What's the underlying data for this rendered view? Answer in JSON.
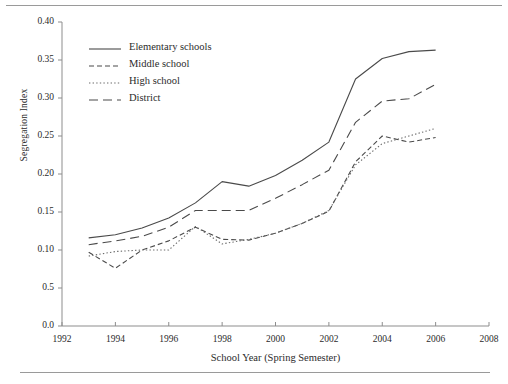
{
  "chart_data": {
    "type": "line",
    "title": "",
    "xlabel": "School Year (Spring Semester)",
    "ylabel": "Segregation Index",
    "xlim": [
      1992,
      2008
    ],
    "ylim": [
      0.0,
      0.4
    ],
    "grid": false,
    "legend_position": "top-left inside plot",
    "xticks": [
      1992,
      1994,
      1996,
      1998,
      2000,
      2002,
      2004,
      2006,
      2008
    ],
    "xtick_labels": [
      "1992",
      "1994",
      "1996",
      "1998",
      "2000",
      "2002",
      "2004",
      "2006",
      "2008"
    ],
    "yticks": [
      0.0,
      0.05,
      0.1,
      0.15,
      0.2,
      0.25,
      0.3,
      0.35,
      0.4
    ],
    "ytick_labels": [
      "0.0",
      "0.5",
      "0.10",
      "0.15",
      "0.20",
      "0.25",
      "0.30",
      "0.35",
      "0.40"
    ],
    "x": [
      1993,
      1994,
      1995,
      1996,
      1997,
      1998,
      1999,
      2000,
      2001,
      2002,
      2003,
      2004,
      2005,
      2006
    ],
    "series": [
      {
        "name": "Elementary schools",
        "style": "solid",
        "color": "#4a4a4a",
        "values": [
          0.116,
          0.12,
          0.129,
          0.142,
          0.162,
          0.19,
          0.184,
          0.198,
          0.218,
          0.242,
          0.325,
          0.352,
          0.361,
          0.363
        ]
      },
      {
        "name": "Middle school",
        "style": "dashed",
        "color": "#4a4a4a",
        "values": [
          0.097,
          0.076,
          0.1,
          0.112,
          0.13,
          0.114,
          0.113,
          0.122,
          0.135,
          0.151,
          0.216,
          0.25,
          0.242,
          0.248
        ]
      },
      {
        "name": "High school",
        "style": "dotted",
        "color": "#6b6b6b",
        "values": [
          0.092,
          0.098,
          0.1,
          0.1,
          0.131,
          0.108,
          0.114,
          0.122,
          0.135,
          0.152,
          0.212,
          0.24,
          0.25,
          0.26
        ]
      },
      {
        "name": "District",
        "style": "longdash",
        "color": "#4a4a4a",
        "values": [
          0.107,
          0.112,
          0.118,
          0.13,
          0.152,
          0.152,
          0.152,
          0.168,
          0.186,
          0.205,
          0.268,
          0.296,
          0.299,
          0.318
        ]
      }
    ]
  },
  "legend": {
    "items": [
      {
        "label": "Elementary schools"
      },
      {
        "label": "Middle school"
      },
      {
        "label": "High school"
      },
      {
        "label": "District"
      }
    ]
  }
}
